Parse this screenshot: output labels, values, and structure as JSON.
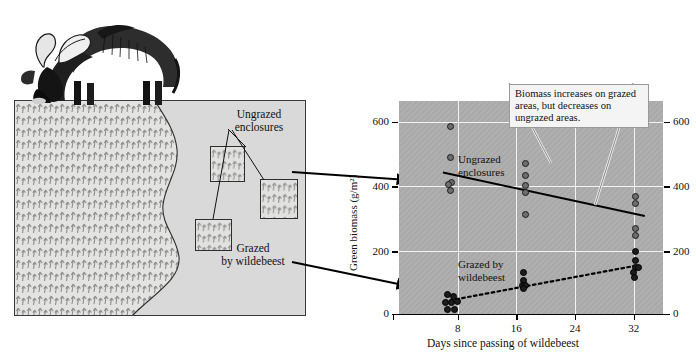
{
  "figure": {
    "illustration": {
      "animal": "wildebeest",
      "labels": {
        "ungrazed": "Ungrazed\nenclosures",
        "ungrazed_line1": "Ungrazed",
        "ungrazed_line2": "enclosures",
        "grazed_line1": "Grazed",
        "grazed_line2": "by wildebeest"
      }
    },
    "callout": {
      "text": "Biomass increases on grazed areas, but decreases on ungrazed areas."
    },
    "plot_labels": {
      "ungrazed_line1": "Ungrazed",
      "ungrazed_line2": "enclosures",
      "grazed_line1": "Grazed by",
      "grazed_line2": "wildebeest"
    }
  },
  "chart_data": {
    "type": "scatter",
    "title": "",
    "xlabel": "Days since passing of wildebeest",
    "ylabel": "Green biomass (g/m²)",
    "xlim": [
      0,
      36
    ],
    "ylim": [
      0,
      660
    ],
    "xticks": [
      8,
      16,
      24,
      32
    ],
    "xtick_labels": [
      "8",
      "16",
      "24",
      "32"
    ],
    "yticks": [
      0,
      200,
      400,
      600
    ],
    "ytick_labels": [
      "0",
      "200",
      "400",
      "600"
    ],
    "ytick_labels_right": [
      "0",
      "200",
      "400",
      "600"
    ],
    "grid": true,
    "legend_position": "in-plot annotations",
    "series": [
      {
        "name": "Ungrazed enclosures",
        "marker": "gray filled circle",
        "color": "#6e6e6e",
        "trend": "solid line, decreasing",
        "trend_points": [
          [
            6.0,
            440
          ],
          [
            33.5,
            305
          ]
        ],
        "points": [
          [
            7.0,
            582
          ],
          [
            7.0,
            487
          ],
          [
            7.2,
            408
          ],
          [
            6.8,
            402
          ],
          [
            7.0,
            383
          ],
          [
            17.2,
            468
          ],
          [
            17.2,
            430
          ],
          [
            17.2,
            400
          ],
          [
            17.2,
            378
          ],
          [
            17.2,
            311
          ],
          [
            32.3,
            365
          ],
          [
            32.3,
            345
          ],
          [
            32.3,
            268
          ],
          [
            32.3,
            245
          ]
        ]
      },
      {
        "name": "Grazed by wildebeest",
        "marker": "black filled circle",
        "color": "#1c1c1c",
        "trend": "dotted line, increasing",
        "trend_points": [
          [
            6.2,
            42
          ],
          [
            32.2,
            152
          ]
        ],
        "points": [
          [
            6.6,
            62
          ],
          [
            7.4,
            58
          ],
          [
            6.4,
            38
          ],
          [
            7.2,
            38
          ],
          [
            8.0,
            42
          ],
          [
            6.6,
            18
          ],
          [
            7.6,
            18
          ],
          [
            17.0,
            132
          ],
          [
            17.0,
            105
          ],
          [
            16.8,
            92
          ],
          [
            17.2,
            90
          ],
          [
            17.0,
            82
          ],
          [
            32.2,
            195
          ],
          [
            32.3,
            168
          ],
          [
            32.2,
            148
          ],
          [
            32.6,
            146
          ],
          [
            32.0,
            130
          ],
          [
            32.1,
            115
          ]
        ]
      }
    ]
  }
}
